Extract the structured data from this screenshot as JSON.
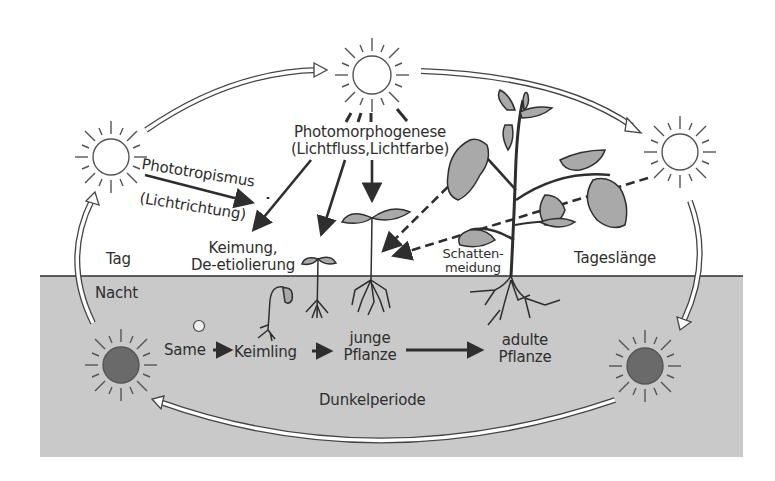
{
  "diagram": {
    "type": "process-cycle",
    "colors": {
      "background": "#ffffff",
      "night_region": "#c9c9c9",
      "line": "#2e2e2e",
      "dark_sun": "#6a6a6a",
      "leaf": "#a9a9a9"
    },
    "regions": {
      "day_label": "Tag",
      "night_label": "Nacht",
      "dark_period_label": "Dunkelperiode",
      "day_length_label": "Tageslänge"
    },
    "light_effects": {
      "photomorphogenesis": {
        "line1": "Photomorphogenese",
        "line2": "(Lichtfluss,Lichtfarbe)"
      },
      "phototropism": {
        "line1": "Phototropismus",
        "line2": "(Lichtrichtung)"
      },
      "germination": {
        "line1": "Keimung,",
        "line2": "De-etiolierung"
      },
      "shade_avoidance": {
        "line1": "Schatten-",
        "line2": "meidung"
      }
    },
    "stages": [
      {
        "label": "Same"
      },
      {
        "label": "Keimling"
      },
      {
        "label_line1": "junge",
        "label_line2": "Pflanze"
      },
      {
        "label_line1": "adulte",
        "label_line2": "Pflanze"
      }
    ],
    "icons": {
      "day_sun": "sun-outline-icon",
      "night_sun": "sun-dark-icon",
      "cycle_arrow": "hollow-arrow-icon"
    }
  }
}
